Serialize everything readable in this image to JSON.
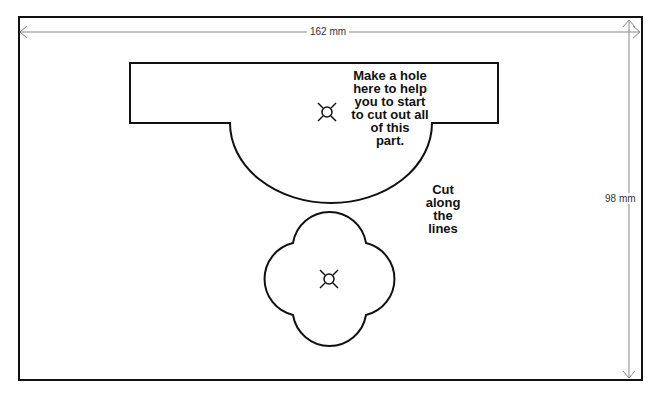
{
  "dimensions": {
    "width_label": "162 mm",
    "height_label": "98 mm"
  },
  "notes": {
    "hole_instruction": "Make a hole\nhere to help\nyou to start\nto cut out all\nof this\npart.",
    "cut_instruction": "Cut\nalong\nthe\nlines"
  },
  "shapes": [
    {
      "name": "top-cutout",
      "type": "rectangle-with-semicircle"
    },
    {
      "name": "quatrefoil-cutout",
      "type": "quatrefoil"
    }
  ],
  "colors": {
    "line": "#111111",
    "dimension_line": "#888888",
    "background": "#ffffff"
  }
}
